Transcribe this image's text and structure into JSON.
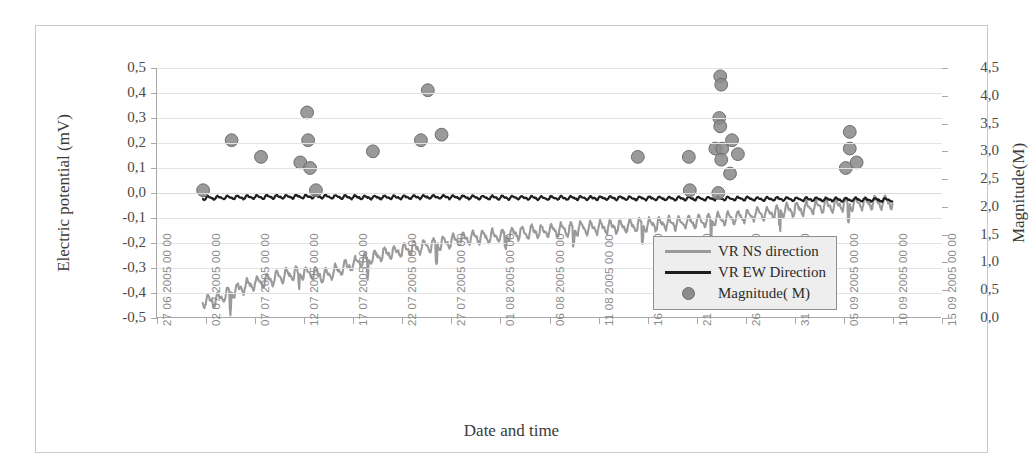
{
  "chart_data": {
    "type": "line",
    "title": "",
    "xlabel": "Date and time",
    "ylabel": "Electric potential (mV)",
    "y2label": "Magnitude(M)",
    "ylim": [
      -0.5,
      0.5
    ],
    "y2lim": [
      0.0,
      4.5
    ],
    "grid": true,
    "legend_position": "inside-right-lower",
    "y_ticks": [
      "0,5",
      "0,4",
      "0,3",
      "0,2",
      "0,1",
      "0,0",
      "-0,1",
      "-0,2",
      "-0,3",
      "-0,4",
      "-0,5"
    ],
    "y_tick_values": [
      0.5,
      0.4,
      0.3,
      0.2,
      0.1,
      0.0,
      -0.1,
      -0.2,
      -0.3,
      -0.4,
      -0.5
    ],
    "y2_ticks": [
      "4,5",
      "4,0",
      "3,5",
      "3,0",
      "2,5",
      "2,0",
      "1,5",
      "1,0",
      "0,5",
      "0,0"
    ],
    "y2_tick_values": [
      4.5,
      4.0,
      3.5,
      3.0,
      2.5,
      2.0,
      1.5,
      1.0,
      0.5,
      0.0
    ],
    "x_ticks": [
      "27 06 2005 00 00",
      "02 07 2005 00 00",
      "07 07 2005 00 00",
      "12 07 2005 00 00",
      "17 07 2005 00 00",
      "22 07 2005 00 00",
      "27 07 2005 00 00",
      "01 08 2005 00 00",
      "06 08 2005 00 00",
      "11 08 2005 00 00",
      "16 08 2005 00 00",
      "21 08 2005 00 00",
      "26 08 2005 00 00",
      "31 08 2005 00 00",
      "05 09 2005 00 00",
      "10 09 2005 00 00",
      "15 09 2005 00 00"
    ],
    "legend": [
      {
        "label": "VR NS direction",
        "marker": "line",
        "color": "#9a9a9a"
      },
      {
        "label": "VR EW Direction",
        "marker": "line",
        "color": "#1f1f1f"
      },
      {
        "label": "Magnitude( M)",
        "marker": "circle",
        "color": "#8c8c8c"
      }
    ],
    "series": [
      {
        "name": "VR NS direction",
        "type": "line",
        "color": "#9a9a9a",
        "axis": "left",
        "x_start_days": 4.6,
        "x_end_days": 75.0,
        "description": "Noisy daily-oscillating trace rising from about -0,43 mV to about -0,03 mV",
        "baseline_points": [
          {
            "day": 4.6,
            "value": -0.432
          },
          {
            "day": 6.0,
            "value": -0.428
          },
          {
            "day": 7.5,
            "value": -0.4
          },
          {
            "day": 9.0,
            "value": -0.372
          },
          {
            "day": 11.0,
            "value": -0.352
          },
          {
            "day": 13.0,
            "value": -0.33
          },
          {
            "day": 15.0,
            "value": -0.318
          },
          {
            "day": 17.0,
            "value": -0.33
          },
          {
            "day": 19.0,
            "value": -0.3
          },
          {
            "day": 21.0,
            "value": -0.27
          },
          {
            "day": 23.0,
            "value": -0.245
          },
          {
            "day": 25.0,
            "value": -0.23
          },
          {
            "day": 27.0,
            "value": -0.215
          },
          {
            "day": 29.0,
            "value": -0.2
          },
          {
            "day": 31.0,
            "value": -0.185
          },
          {
            "day": 34.0,
            "value": -0.172
          },
          {
            "day": 37.0,
            "value": -0.16
          },
          {
            "day": 40.0,
            "value": -0.15
          },
          {
            "day": 44.0,
            "value": -0.14
          },
          {
            "day": 48.0,
            "value": -0.132
          },
          {
            "day": 52.0,
            "value": -0.122
          },
          {
            "day": 56.0,
            "value": -0.11
          },
          {
            "day": 60.0,
            "value": -0.092
          },
          {
            "day": 64.0,
            "value": -0.07
          },
          {
            "day": 68.0,
            "value": -0.052
          },
          {
            "day": 71.0,
            "value": -0.042
          },
          {
            "day": 75.0,
            "value": -0.035
          }
        ],
        "oscillation_amplitude": 0.032,
        "oscillation_period_days": 1.0
      },
      {
        "name": "VR EW Direction",
        "type": "line",
        "color": "#1f1f1f",
        "axis": "left",
        "x_start_days": 4.6,
        "x_end_days": 75.0,
        "description": "Nearly flat dark trace just below 0,0 mV with small daily ripple",
        "baseline_points": [
          {
            "day": 4.6,
            "value": -0.02
          },
          {
            "day": 10.0,
            "value": -0.016
          },
          {
            "day": 16.0,
            "value": -0.014
          },
          {
            "day": 22.0,
            "value": -0.018
          },
          {
            "day": 28.0,
            "value": -0.016
          },
          {
            "day": 34.0,
            "value": -0.018
          },
          {
            "day": 40.0,
            "value": -0.02
          },
          {
            "day": 46.0,
            "value": -0.02
          },
          {
            "day": 52.0,
            "value": -0.022
          },
          {
            "day": 58.0,
            "value": -0.022
          },
          {
            "day": 64.0,
            "value": -0.024
          },
          {
            "day": 70.0,
            "value": -0.026
          },
          {
            "day": 75.0,
            "value": -0.028
          }
        ],
        "oscillation_amplitude": 0.009,
        "oscillation_period_days": 1.0
      },
      {
        "name": "Magnitude( M)",
        "type": "scatter",
        "color": "#8c8c8c",
        "axis": "right",
        "points": [
          {
            "day": 4.7,
            "magnitude": 2.3
          },
          {
            "day": 7.6,
            "magnitude": 3.2
          },
          {
            "day": 10.6,
            "magnitude": 2.9
          },
          {
            "day": 15.3,
            "magnitude": 3.7
          },
          {
            "day": 15.4,
            "magnitude": 3.2
          },
          {
            "day": 14.6,
            "magnitude": 2.8
          },
          {
            "day": 15.6,
            "magnitude": 2.7
          },
          {
            "day": 16.2,
            "magnitude": 2.3
          },
          {
            "day": 22.0,
            "magnitude": 3.0
          },
          {
            "day": 27.6,
            "magnitude": 4.1
          },
          {
            "day": 26.9,
            "magnitude": 3.2
          },
          {
            "day": 29.0,
            "magnitude": 3.3
          },
          {
            "day": 49.0,
            "magnitude": 2.9
          },
          {
            "day": 54.2,
            "magnitude": 2.9
          },
          {
            "day": 54.3,
            "magnitude": 2.3
          },
          {
            "day": 57.4,
            "magnitude": 4.35
          },
          {
            "day": 57.5,
            "magnitude": 4.2
          },
          {
            "day": 57.3,
            "magnitude": 3.6
          },
          {
            "day": 57.4,
            "magnitude": 3.45
          },
          {
            "day": 56.9,
            "magnitude": 3.05
          },
          {
            "day": 57.6,
            "magnitude": 3.05
          },
          {
            "day": 57.5,
            "magnitude": 2.85
          },
          {
            "day": 58.6,
            "magnitude": 3.2
          },
          {
            "day": 59.2,
            "magnitude": 2.95
          },
          {
            "day": 58.4,
            "magnitude": 2.6
          },
          {
            "day": 57.2,
            "magnitude": 2.25
          },
          {
            "day": 70.6,
            "magnitude": 3.35
          },
          {
            "day": 70.6,
            "magnitude": 3.05
          },
          {
            "day": 70.2,
            "magnitude": 2.7
          },
          {
            "day": 71.3,
            "magnitude": 2.8
          }
        ]
      }
    ]
  }
}
